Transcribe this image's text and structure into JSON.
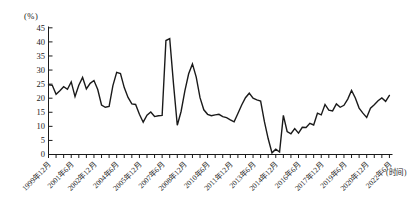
{
  "chart": {
    "percent_unit_label": "(%)",
    "time_unit_label": "(时间)",
    "line_color": "#1a1a1a",
    "axis_color": "#1a1a1a",
    "y_ticks": [
      0,
      5,
      10,
      15,
      20,
      25,
      30,
      35,
      40,
      45
    ],
    "x_tick_labels": [
      "1999年12月",
      "2001年6月",
      "2002年12月",
      "2004年6月",
      "2005年12月",
      "2007年6月",
      "2008年12月",
      "2010年6月",
      "2011年12月",
      "2013年6月",
      "2014年12月",
      "2016年6月",
      "2017年12月",
      "2019年6月",
      "2020年12月",
      "2022年6月"
    ]
  },
  "chart_data": {
    "type": "line",
    "title": "",
    "xlabel": "(时间)",
    "ylabel": "(%)",
    "ylim": [
      0,
      45
    ],
    "grid": false,
    "legend": "none",
    "frequency": "quarterly",
    "x_start": "1999-Q4",
    "x_end": "2022-Q2",
    "x_labeled_ticks": [
      "1999年12月",
      "2001年6月",
      "2002年12月",
      "2004年6月",
      "2005年12月",
      "2007年6月",
      "2008年12月",
      "2010年6月",
      "2011年12月",
      "2013年6月",
      "2014年12月",
      "2016年6月",
      "2017年12月",
      "2019年6月",
      "2020年12月",
      "2022年6月"
    ],
    "minor_tick_interval_months": 6,
    "label_tick_interval_months": 18,
    "values": [
      24.6,
      24.4,
      21.2,
      22.5,
      23.9,
      23.0,
      25.6,
      20.4,
      24.4,
      27.2,
      23.1,
      25.1,
      26.1,
      22.9,
      17.4,
      16.6,
      16.9,
      24.3,
      29.0,
      28.6,
      23.6,
      20.1,
      17.8,
      17.6,
      14.1,
      11.3,
      13.8,
      14.9,
      13.3,
      13.6,
      13.7,
      40.3,
      41.0,
      24.9,
      10.2,
      15.1,
      22.4,
      28.5,
      32.0,
      27.3,
      20.0,
      15.7,
      14.1,
      13.6,
      13.9,
      14.1,
      13.3,
      12.9,
      12.1,
      11.4,
      14.4,
      17.4,
      20.0,
      21.6,
      19.8,
      19.2,
      18.8,
      11.5,
      5.4,
      0.4,
      1.7,
      0.7,
      13.7,
      8.0,
      7.2,
      9.0,
      7.4,
      9.5,
      9.4,
      10.9,
      10.3,
      14.5,
      13.9,
      17.6,
      15.6,
      15.3,
      17.8,
      16.6,
      17.3,
      19.5,
      22.6,
      19.9,
      16.3,
      14.5,
      13.0,
      16.3,
      17.5,
      18.9,
      19.9,
      18.7,
      20.8
    ]
  }
}
